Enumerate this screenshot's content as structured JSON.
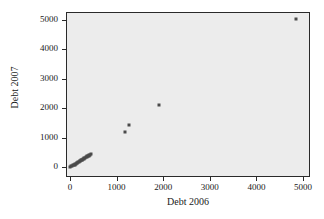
{
  "chart_data": {
    "type": "scatter",
    "title": "",
    "xlabel": "Debt 2006",
    "ylabel": "Debt 2007",
    "xlim": [
      0,
      5000
    ],
    "ylim": [
      0,
      5000
    ],
    "xticks": [
      0,
      1000,
      2000,
      3000,
      4000,
      5000
    ],
    "yticks": [
      0,
      1000,
      2000,
      3000,
      4000,
      5000
    ],
    "xtick_labels": [
      "0",
      "1000",
      "2000",
      "3000",
      "4000",
      "5000"
    ],
    "ytick_labels": [
      "0",
      "1000",
      "2000",
      "3000",
      "4000",
      "5000"
    ],
    "grid": false,
    "legend": false,
    "marker_color": "#4a4a4a",
    "plot_background": "#ececec",
    "points": [
      {
        "x": 10,
        "y": 5
      },
      {
        "x": 30,
        "y": 20
      },
      {
        "x": 50,
        "y": 40
      },
      {
        "x": 70,
        "y": 55
      },
      {
        "x": 85,
        "y": 70
      },
      {
        "x": 100,
        "y": 85
      },
      {
        "x": 115,
        "y": 100
      },
      {
        "x": 130,
        "y": 115
      },
      {
        "x": 145,
        "y": 130
      },
      {
        "x": 160,
        "y": 150
      },
      {
        "x": 175,
        "y": 165
      },
      {
        "x": 190,
        "y": 180
      },
      {
        "x": 205,
        "y": 195
      },
      {
        "x": 220,
        "y": 210
      },
      {
        "x": 235,
        "y": 225
      },
      {
        "x": 250,
        "y": 240
      },
      {
        "x": 265,
        "y": 255
      },
      {
        "x": 280,
        "y": 270
      },
      {
        "x": 295,
        "y": 285
      },
      {
        "x": 310,
        "y": 300
      },
      {
        "x": 325,
        "y": 315
      },
      {
        "x": 340,
        "y": 330
      },
      {
        "x": 355,
        "y": 345
      },
      {
        "x": 370,
        "y": 360
      },
      {
        "x": 385,
        "y": 375
      },
      {
        "x": 400,
        "y": 390
      },
      {
        "x": 415,
        "y": 405
      },
      {
        "x": 430,
        "y": 420
      },
      {
        "x": 450,
        "y": 435
      },
      {
        "x": 1180,
        "y": 1180
      },
      {
        "x": 1260,
        "y": 1420
      },
      {
        "x": 1900,
        "y": 2120
      },
      {
        "x": 4850,
        "y": 5020
      }
    ]
  }
}
